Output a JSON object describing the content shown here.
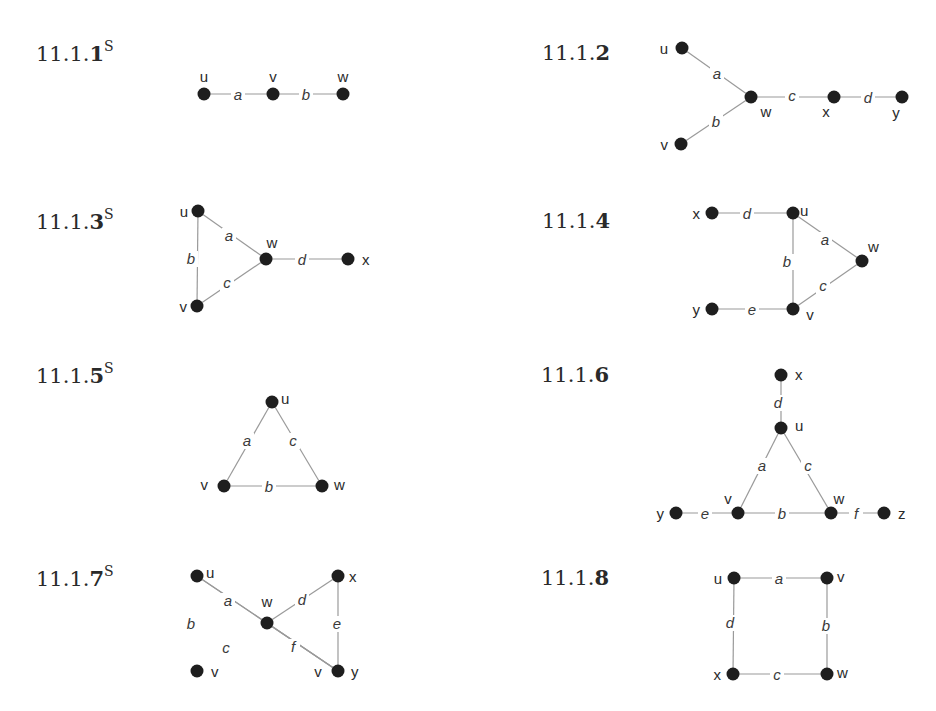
{
  "exercises": [
    {
      "id": "11.1.1",
      "prefix": "11.1.",
      "last_digit": "1",
      "superscript": "S",
      "label_pos": [
        36,
        40
      ],
      "vertices": [
        {
          "name": "u",
          "x": 204,
          "y": 94,
          "lx": 204,
          "ly": 82,
          "anchor": "middle"
        },
        {
          "name": "v",
          "x": 273,
          "y": 94,
          "lx": 273,
          "ly": 82,
          "anchor": "middle"
        },
        {
          "name": "w",
          "x": 343,
          "y": 94,
          "lx": 343,
          "ly": 82,
          "anchor": "middle"
        }
      ],
      "edges": [
        {
          "label": "a",
          "from": "u",
          "to": "v",
          "lx": 238,
          "ly": 100
        },
        {
          "label": "b",
          "from": "v",
          "to": "w",
          "lx": 306,
          "ly": 100
        }
      ]
    },
    {
      "id": "11.1.2",
      "prefix": "11.1.",
      "last_digit": "2",
      "superscript": "",
      "label_pos": [
        542,
        40
      ],
      "vertices": [
        {
          "name": "u",
          "x": 682,
          "y": 48,
          "lx": 668,
          "ly": 54,
          "anchor": "end"
        },
        {
          "name": "w",
          "x": 751,
          "y": 97,
          "lx": 766,
          "ly": 117,
          "anchor": "middle"
        },
        {
          "name": "v",
          "x": 681,
          "y": 144,
          "lx": 668,
          "ly": 150,
          "anchor": "end"
        },
        {
          "name": "x",
          "x": 834,
          "y": 97,
          "lx": 826,
          "ly": 117,
          "anchor": "middle"
        },
        {
          "name": "y",
          "x": 902,
          "y": 97,
          "lx": 896,
          "ly": 118,
          "anchor": "middle"
        }
      ],
      "edges": [
        {
          "label": "a",
          "from": "u",
          "to": "w",
          "lx": 717,
          "ly": 79
        },
        {
          "label": "b",
          "from": "v",
          "to": "w",
          "lx": 716,
          "ly": 127
        },
        {
          "label": "c",
          "from": "w",
          "to": "x",
          "lx": 792,
          "ly": 101
        },
        {
          "label": "d",
          "from": "x",
          "to": "y",
          "lx": 868,
          "ly": 103
        }
      ]
    },
    {
      "id": "11.1.3",
      "prefix": "11.1.",
      "last_digit": "3",
      "superscript": "S",
      "label_pos": [
        36,
        208
      ],
      "vertices": [
        {
          "name": "u",
          "x": 198,
          "y": 211,
          "lx": 188,
          "ly": 217,
          "anchor": "end"
        },
        {
          "name": "w",
          "x": 266,
          "y": 259,
          "lx": 272,
          "ly": 248,
          "anchor": "middle"
        },
        {
          "name": "v",
          "x": 197,
          "y": 306,
          "lx": 187,
          "ly": 312,
          "anchor": "end"
        },
        {
          "name": "x",
          "x": 348,
          "y": 259,
          "lx": 362,
          "ly": 265,
          "anchor": "start"
        }
      ],
      "edges": [
        {
          "label": "a",
          "from": "u",
          "to": "w",
          "lx": 229,
          "ly": 241
        },
        {
          "label": "b",
          "from": "u",
          "to": "v",
          "lx": 191,
          "ly": 264
        },
        {
          "label": "c",
          "from": "v",
          "to": "w",
          "lx": 227,
          "ly": 288
        },
        {
          "label": "d",
          "from": "w",
          "to": "x",
          "lx": 302,
          "ly": 265
        }
      ]
    },
    {
      "id": "11.1.4",
      "prefix": "11.1.",
      "last_digit": "4",
      "superscript": "",
      "label_pos": [
        542,
        208
      ],
      "vertices": [
        {
          "name": "x",
          "x": 712,
          "y": 213,
          "lx": 700,
          "ly": 219,
          "anchor": "end"
        },
        {
          "name": "u",
          "x": 793,
          "y": 213,
          "lx": 800,
          "ly": 216,
          "anchor": "start"
        },
        {
          "name": "w",
          "x": 862,
          "y": 261,
          "lx": 868,
          "ly": 252,
          "anchor": "start"
        },
        {
          "name": "v",
          "x": 793,
          "y": 309,
          "lx": 810,
          "ly": 320,
          "anchor": "middle"
        },
        {
          "name": "y",
          "x": 712,
          "y": 309,
          "lx": 700,
          "ly": 315,
          "anchor": "end"
        }
      ],
      "edges": [
        {
          "label": "d",
          "from": "x",
          "to": "u",
          "lx": 747,
          "ly": 219
        },
        {
          "label": "a",
          "from": "u",
          "to": "w",
          "lx": 825,
          "ly": 245
        },
        {
          "label": "b",
          "from": "u",
          "to": "v",
          "lx": 787,
          "ly": 267
        },
        {
          "label": "c",
          "from": "v",
          "to": "w",
          "lx": 823,
          "ly": 291
        },
        {
          "label": "e",
          "from": "y",
          "to": "v",
          "lx": 752,
          "ly": 315
        }
      ]
    },
    {
      "id": "11.1.5",
      "prefix": "11.1.",
      "last_digit": "5",
      "superscript": "S",
      "label_pos": [
        36,
        362
      ],
      "vertices": [
        {
          "name": "u",
          "x": 272,
          "y": 402,
          "lx": 281,
          "ly": 404,
          "anchor": "start"
        },
        {
          "name": "v",
          "x": 224,
          "y": 486,
          "lx": 208,
          "ly": 490,
          "anchor": "end"
        },
        {
          "name": "w",
          "x": 322,
          "y": 486,
          "lx": 334,
          "ly": 490,
          "anchor": "start"
        }
      ],
      "edges": [
        {
          "label": "a",
          "from": "u",
          "to": "v",
          "lx": 247,
          "ly": 446
        },
        {
          "label": "c",
          "from": "u",
          "to": "w",
          "lx": 293,
          "ly": 446
        },
        {
          "label": "b",
          "from": "v",
          "to": "w",
          "lx": 269,
          "ly": 492
        }
      ]
    },
    {
      "id": "11.1.6",
      "prefix": "11.1.",
      "last_digit": "6",
      "superscript": "",
      "label_pos": [
        541,
        362
      ],
      "vertices": [
        {
          "name": "x",
          "x": 781,
          "y": 375,
          "lx": 795,
          "ly": 380,
          "anchor": "start"
        },
        {
          "name": "u",
          "x": 781,
          "y": 428,
          "lx": 795,
          "ly": 431,
          "anchor": "start"
        },
        {
          "name": "v",
          "x": 738,
          "y": 513,
          "lx": 728,
          "ly": 504,
          "anchor": "middle"
        },
        {
          "name": "w",
          "x": 831,
          "y": 513,
          "lx": 839,
          "ly": 504,
          "anchor": "middle"
        },
        {
          "name": "y",
          "x": 676,
          "y": 513,
          "lx": 664,
          "ly": 519,
          "anchor": "end"
        },
        {
          "name": "z",
          "x": 884,
          "y": 513,
          "lx": 898,
          "ly": 519,
          "anchor": "start"
        }
      ],
      "edges": [
        {
          "label": "d",
          "from": "x",
          "to": "u",
          "lx": 778,
          "ly": 408
        },
        {
          "label": "a",
          "from": "u",
          "to": "v",
          "lx": 762,
          "ly": 471
        },
        {
          "label": "c",
          "from": "u",
          "to": "w",
          "lx": 808,
          "ly": 471
        },
        {
          "label": "b",
          "from": "v",
          "to": "w",
          "lx": 782,
          "ly": 519
        },
        {
          "label": "e",
          "from": "y",
          "to": "v",
          "lx": 705,
          "ly": 519
        },
        {
          "label": "f",
          "from": "w",
          "to": "z",
          "lx": 856,
          "ly": 519
        }
      ]
    },
    {
      "id": "11.1.7",
      "prefix": "11.1.",
      "last_digit": "7",
      "superscript": "S",
      "label_pos": [
        36,
        565
      ],
      "vertices": [
        {
          "name": "u",
          "x": 197,
          "y": 576,
          "lx": 206,
          "ly": 578,
          "anchor": "start"
        },
        {
          "name": "w",
          "x": 267,
          "y": 623,
          "lx": 267,
          "ly": 607,
          "anchor": "middle"
        },
        {
          "name": "x",
          "x": 338,
          "y": 576,
          "lx": 349,
          "ly": 582,
          "anchor": "start"
        },
        {
          "name": "v",
          "x": 197,
          "y": 671,
          "lx": 211,
          "ly": 677,
          "anchor": "start"
        },
        {
          "name": "v",
          "x": 338,
          "y": 671,
          "lx": 318,
          "ly": 677,
          "anchor": "middle"
        },
        {
          "name": "y",
          "x": 338,
          "y": 671,
          "lx": 351,
          "ly": 677,
          "anchor": "start"
        }
      ],
      "edges": [
        {
          "label": "a",
          "from": "u",
          "to": "w",
          "lx": 228,
          "ly": 606
        },
        {
          "label": "b",
          "from": "u",
          "to": "v1",
          "lx": 191,
          "ly": 629
        },
        {
          "label": "c",
          "from": "v1",
          "to": "w",
          "lx": 226,
          "ly": 653
        },
        {
          "label": "d",
          "from": "w",
          "to": "x",
          "lx": 302,
          "ly": 605
        },
        {
          "label": "e",
          "from": "x",
          "to": "y",
          "lx": 337,
          "ly": 629
        },
        {
          "label": "f",
          "from": "w",
          "to": "y",
          "lx": 293,
          "ly": 652
        }
      ]
    },
    {
      "id": "11.1.8",
      "prefix": "11.1.",
      "last_digit": "8",
      "superscript": "",
      "label_pos": [
        541,
        565
      ],
      "vertices": [
        {
          "name": "u",
          "x": 734,
          "y": 578,
          "lx": 722,
          "ly": 584,
          "anchor": "end"
        },
        {
          "name": "v",
          "x": 827,
          "y": 578,
          "lx": 837,
          "ly": 582,
          "anchor": "start"
        },
        {
          "name": "x",
          "x": 733,
          "y": 674,
          "lx": 721,
          "ly": 680,
          "anchor": "end"
        },
        {
          "name": "w",
          "x": 827,
          "y": 674,
          "lx": 837,
          "ly": 678,
          "anchor": "start"
        }
      ],
      "edges": [
        {
          "label": "a",
          "from": "u",
          "to": "v",
          "lx": 779,
          "ly": 584
        },
        {
          "label": "b",
          "from": "v",
          "to": "w",
          "lx": 826,
          "ly": 631
        },
        {
          "label": "c",
          "from": "x",
          "to": "w",
          "lx": 777,
          "ly": 680
        },
        {
          "label": "d",
          "from": "u",
          "to": "x",
          "lx": 730,
          "ly": 628
        }
      ]
    }
  ]
}
